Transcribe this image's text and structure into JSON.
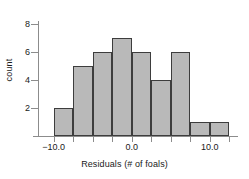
{
  "chart_data": {
    "type": "bar",
    "title": "",
    "subtitle": "",
    "xlabel": "Residuals (# of foals)",
    "ylabel": "count",
    "bin_width": 2.5,
    "bin_edges": [
      -10.0,
      -7.5,
      -5.0,
      -2.5,
      0.0,
      2.5,
      5.0,
      7.5,
      10.0,
      12.5
    ],
    "categories": [
      "-10.0 to -7.5",
      "-7.5 to -5.0",
      "-5.0 to -2.5",
      "-2.5 to 0.0",
      "0.0 to 2.5",
      "2.5 to 5.0",
      "5.0 to 7.5",
      "7.5 to 10.0",
      "10.0 to 12.5"
    ],
    "values": [
      2,
      5,
      6,
      7,
      6,
      4,
      6,
      1,
      1
    ],
    "xlim": [
      -12.0,
      13.6
    ],
    "ylim": [
      0,
      8.4
    ],
    "xticks": [
      -10.0,
      0.0,
      10.0
    ],
    "xtick_labels": [
      "−10.0",
      "0.0",
      "10.0"
    ],
    "yticks": [
      2,
      4,
      6,
      8
    ],
    "ytick_labels": [
      "2",
      "4",
      "6",
      "8"
    ],
    "xtick_minor": [
      -10.0,
      -7.5,
      -5.0,
      -2.5,
      0.0,
      2.5,
      5.0,
      7.5,
      10.0,
      12.5
    ],
    "grid": false,
    "legend": "none",
    "bar_fill_color": "#b9b9b9",
    "bar_border_color": "#3d3d3d",
    "axis_color": "#8c8c8c",
    "text_color": "#1a1a1a",
    "background_color": "#ffffff"
  }
}
